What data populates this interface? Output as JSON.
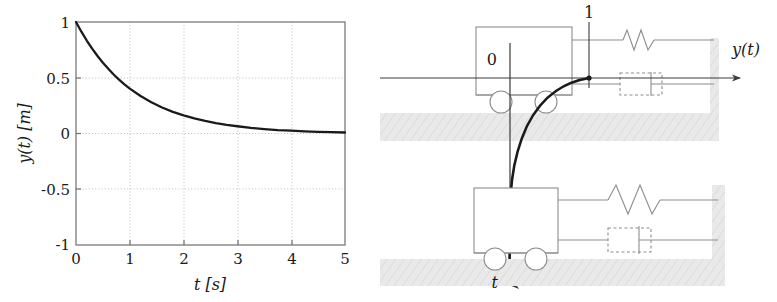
{
  "figure": {
    "panels": [
      "response-plot",
      "mass-spring-damper-diagram"
    ],
    "background_color": "#ffffff",
    "ink_color": "#1a1a1a",
    "grid_color": "#b4b4b4",
    "structure_color": "#9a9a9a",
    "hatch_color": "#e2e2e2"
  },
  "chart_data": {
    "type": "line",
    "title": "",
    "xlabel": "t [s]",
    "ylabel": "y(t) [m]",
    "xlim": [
      0,
      5
    ],
    "ylim": [
      -1,
      1
    ],
    "grid": true,
    "legend": null,
    "xticks": [
      "0",
      "1",
      "2",
      "3",
      "4",
      "5"
    ],
    "xtick_values": [
      0,
      1,
      2,
      3,
      4,
      5
    ],
    "yticks": [
      "1",
      "0.5",
      "0",
      "-0.5",
      "-1"
    ],
    "ytick_values": [
      1,
      0.5,
      0,
      -0.5,
      -1
    ],
    "series": [
      {
        "name": "y(t)",
        "color": "#1a1a1a",
        "x": [
          0,
          0.1,
          0.2,
          0.3,
          0.4,
          0.5,
          0.6,
          0.7,
          0.8,
          0.9,
          1.0,
          1.2,
          1.4,
          1.6,
          1.8,
          2.0,
          2.2,
          2.4,
          2.6,
          2.8,
          3.0,
          3.25,
          3.5,
          3.75,
          4.0,
          4.25,
          4.5,
          4.75,
          5.0
        ],
        "y": [
          1.0,
          0.913,
          0.834,
          0.761,
          0.695,
          0.635,
          0.58,
          0.529,
          0.483,
          0.441,
          0.403,
          0.336,
          0.28,
          0.233,
          0.194,
          0.162,
          0.135,
          0.113,
          0.094,
          0.078,
          0.065,
          0.051,
          0.04,
          0.031,
          0.025,
          0.019,
          0.015,
          0.012,
          0.009
        ]
      }
    ]
  },
  "diagram": {
    "name": "step-response-cart-spring-damper",
    "labels": {
      "zero": "0",
      "one": "1",
      "y_axis": "y(t)",
      "t_axis": "t"
    },
    "elements": {
      "upper_cart": "cart-upper",
      "lower_cart": "cart-lower",
      "upper_spring": "spring-upper",
      "lower_spring": "spring-lower",
      "upper_damper": "damper-upper",
      "lower_damper": "damper-lower",
      "upper_wall": "wall-upper",
      "lower_wall": "wall-lower",
      "upper_ground": "ground-upper",
      "lower_ground": "ground-lower",
      "response_curve": "response-curve"
    }
  }
}
